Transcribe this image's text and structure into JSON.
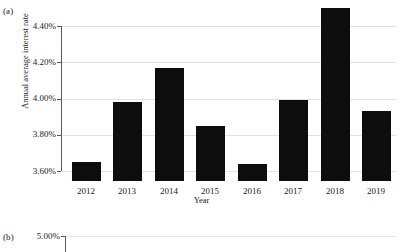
{
  "figure": {
    "panel_a_tag": "(a)",
    "panel_b_tag": "(b)"
  },
  "chart_data": {
    "type": "bar",
    "title": "",
    "xlabel": "Year",
    "ylabel": "Annual average interest rate",
    "categories": [
      "2012",
      "2013",
      "2014",
      "2015",
      "2016",
      "2017",
      "2018",
      "2019"
    ],
    "values": [
      3.65,
      3.98,
      4.17,
      3.85,
      3.64,
      3.99,
      4.5,
      3.93
    ],
    "value_labels": [
      "3.65%",
      "3.98%",
      "4.17%",
      "3.85%",
      "3.64%",
      "3.99%",
      "4.50%",
      "3.93%"
    ],
    "ylim": [
      3.6,
      4.4
    ],
    "ytick_values": [
      3.6,
      3.8,
      4.0,
      4.2,
      4.4
    ],
    "ytick_labels": [
      "3.60%",
      "3.80%",
      "4.00%",
      "4.20%",
      "4.40%"
    ],
    "grid": true,
    "legend": "none",
    "bar_color": "#0d0d0d",
    "gridline_color": "#e2e2e2",
    "axis_color": "#5a5a5a"
  },
  "panel_b": {
    "top_ytick_label": "5.00%"
  }
}
